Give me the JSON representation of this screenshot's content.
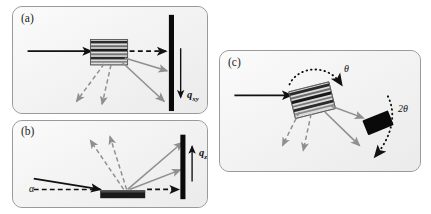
{
  "figure": {
    "type": "scattering-geometry-diagram",
    "background": "#ffffff",
    "panel_fill": "#f2f2f2",
    "panel_border": "#9a9a9a",
    "beam_color": "#111111",
    "scatter_color": "#8f8f8f",
    "detector_color": "#0a0a0a"
  },
  "panels": {
    "a": {
      "label": "(a)",
      "symbol_q": "q",
      "symbol_q_sub": "xy",
      "sample": "striped-film-sample",
      "detector": "vertical-bar-detector",
      "incident_beam": "horizontal-incident-beam",
      "transmitted_beam": "dashed-transmitted-beam",
      "scattered_beams": "solid-and-dashed-scattered-beams"
    },
    "b": {
      "label": "(b)",
      "symbol_q": "q",
      "symbol_q_sub": "z",
      "symbol_alpha": "α",
      "sample": "dark-substrate-sample",
      "detector": "vertical-bar-detector",
      "incident_beam": "grazing-incidence-beam",
      "transmitted_beam": "dashed-specular-beam",
      "scattered_beams": "solid-and-dashed-scattered-beams"
    },
    "c": {
      "label": "(c)",
      "symbol_theta": "θ",
      "symbol_two_theta": "2θ",
      "sample": "striped-rotating-sample",
      "detector": "tilted-block-detector",
      "incident_beam": "horizontal-incident-beam",
      "scattered_beams": "solid-and-dashed-scattered-beams",
      "rotation_arc_sample": "dotted-theta-rotation-arc",
      "rotation_arc_detector": "dotted-two-theta-rotation-arc"
    }
  }
}
